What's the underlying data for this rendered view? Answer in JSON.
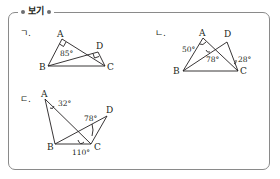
{
  "box": {
    "title": "보기"
  },
  "items": [
    {
      "label": "ㄱ.",
      "points": {
        "A": "A",
        "B": "B",
        "C": "C",
        "D": "D"
      },
      "angles": [
        "85°"
      ]
    },
    {
      "label": "ㄴ.",
      "points": {
        "A": "A",
        "B": "B",
        "C": "C",
        "D": "D"
      },
      "angles": [
        "50°",
        "78°",
        "28°"
      ]
    },
    {
      "label": "ㄷ.",
      "points": {
        "A": "A",
        "B": "B",
        "C": "C",
        "D": "D"
      },
      "angles": [
        "32°",
        "78°",
        "110°"
      ]
    }
  ]
}
